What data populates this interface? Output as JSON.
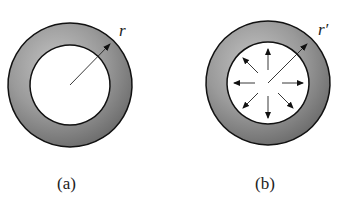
{
  "figures": [
    {
      "id": "a",
      "caption": "(a)",
      "radius_label": "r",
      "description": "ring with radius arrow"
    },
    {
      "id": "b",
      "caption": "(b)",
      "radius_label": "r′",
      "description": "ring with outward pressure arrows"
    }
  ],
  "colors": {
    "ring_fill_dark": "#6e6e6e",
    "ring_fill_light": "#b5b5b5",
    "stroke": "#111111"
  }
}
